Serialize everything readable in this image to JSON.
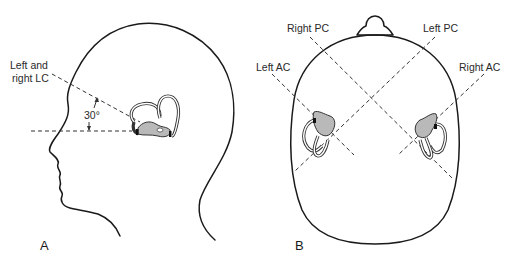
{
  "figure": {
    "panels": [
      {
        "id": "A",
        "letter": "A",
        "view": "lateral head profile",
        "labels": {
          "lc_line1": "Left and",
          "lc_line2": "right LC",
          "angle": "30°"
        }
      },
      {
        "id": "B",
        "letter": "B",
        "view": "top-down skull",
        "labels": {
          "right_pc": "Right PC",
          "left_pc": "Left PC",
          "left_ac": "Left AC",
          "right_ac": "Right AC"
        }
      }
    ],
    "colors": {
      "line": "#1a1a1a",
      "vestibule_fill": "#b9b9b9",
      "background": "#ffffff"
    }
  }
}
